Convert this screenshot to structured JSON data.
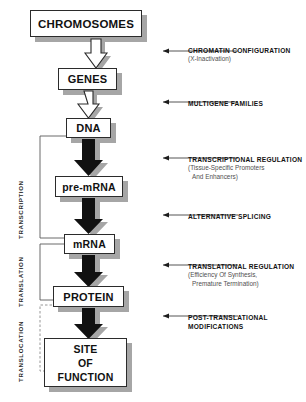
{
  "diagram": {
    "nodes": [
      {
        "id": "chromosomes",
        "label": "CHROMOSOMES",
        "x": 30,
        "y": 10,
        "w": 112,
        "h": 27,
        "font": 11.5
      },
      {
        "id": "genes",
        "label": "GENES",
        "x": 58,
        "y": 68,
        "w": 59,
        "h": 22,
        "font": 11
      },
      {
        "id": "dna",
        "label": "DNA",
        "x": 66,
        "y": 118,
        "w": 45,
        "h": 20,
        "font": 11
      },
      {
        "id": "premrna",
        "label": "pre-mRNA",
        "x": 55,
        "y": 176,
        "w": 68,
        "h": 21,
        "font": 10.5
      },
      {
        "id": "mrna",
        "label": "mRNA",
        "x": 64,
        "y": 234,
        "w": 51,
        "h": 20,
        "font": 10.5
      },
      {
        "id": "protein",
        "label": "PROTEIN",
        "x": 53,
        "y": 286,
        "w": 71,
        "h": 21,
        "font": 11
      },
      {
        "id": "site_of_function",
        "label": "SITE\nOF\nFUNCTION",
        "x": 44,
        "y": 338,
        "w": 83,
        "h": 49,
        "font": 10.5
      }
    ],
    "arrows": [
      {
        "id": "chromosomes-to-genes",
        "style": "hollow",
        "from": "chromosomes",
        "to": "genes"
      },
      {
        "id": "genes-to-dna",
        "style": "hollow",
        "from": "genes",
        "to": "dna"
      },
      {
        "id": "dna-to-premrna",
        "style": "solid",
        "from": "dna",
        "to": "premrna"
      },
      {
        "id": "premrna-to-mrna",
        "style": "solid",
        "from": "premrna",
        "to": "mrna"
      },
      {
        "id": "mrna-to-protein",
        "style": "solid",
        "from": "mrna",
        "to": "protein"
      },
      {
        "id": "protein-to-site",
        "style": "solid",
        "from": "protein",
        "to": "site_of_function"
      }
    ],
    "annotations": [
      {
        "id": "chromatin-configuration",
        "title": "CHROMATIN CONFIGURATION",
        "sub": [
          "(X-Inactivation)"
        ],
        "x": 188,
        "y": 46,
        "arrow_y": 51,
        "arrow_x1": 238,
        "arrow_x2": 161
      },
      {
        "id": "multigene-families",
        "title": "MULTIGENE FAMILIES",
        "sub": [],
        "x": 188,
        "y": 99,
        "arrow_y": 102,
        "arrow_x1": 238,
        "arrow_x2": 161
      },
      {
        "id": "transcriptional-regulation",
        "title": "TRANSCRIPTIONAL REGULATION",
        "sub": [
          "(Tissue-Specific Promoters",
          "And Enhancers)"
        ],
        "x": 188,
        "y": 155,
        "arrow_y": 158,
        "arrow_x1": 238,
        "arrow_x2": 161
      },
      {
        "id": "alternative-splicing",
        "title": "ALTERNATIVE SPLICING",
        "sub": [],
        "x": 188,
        "y": 212,
        "arrow_y": 215,
        "arrow_x1": 238,
        "arrow_x2": 161
      },
      {
        "id": "translational-regulation",
        "title": "TRANSLATIONAL REGULATION",
        "sub": [
          "(Efficiency Of Synthesis,",
          "Premature Termination)"
        ],
        "x": 188,
        "y": 262,
        "arrow_y": 265,
        "arrow_x1": 238,
        "arrow_x2": 161
      },
      {
        "id": "post-translational-modifications",
        "title": "POST-TRANSLATIONAL",
        "sub": [
          "MODIFICATIONS"
        ],
        "sub_bold": true,
        "x": 188,
        "y": 313,
        "arrow_y": 316,
        "arrow_x1": 238,
        "arrow_x2": 161
      }
    ],
    "phases": [
      {
        "id": "transcription",
        "label": "TRANSCRIPTION",
        "x": 24,
        "y": 232,
        "bracket_top": 136,
        "bracket_bottom": 238,
        "dashed": false
      },
      {
        "id": "translation",
        "label": "TRANSLATION",
        "x": 24,
        "y": 300,
        "bracket_top": 244,
        "bracket_bottom": 300,
        "dashed": false
      },
      {
        "id": "translocation",
        "label": "TRANSLOCATION",
        "x": 24,
        "y": 375,
        "bracket_top": 305,
        "bracket_bottom": 371,
        "dashed": true
      }
    ],
    "colors": {
      "background": "#ffffff",
      "box_border": "#2b2b2b",
      "shadow": "#a6a6a6",
      "arrow_solid": "#111111",
      "arrow_hollow_fill": "#ffffff",
      "text": "#121212",
      "subtext": "#4f4f4f"
    }
  }
}
